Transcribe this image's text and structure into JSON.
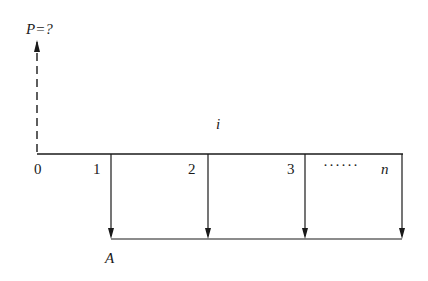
{
  "diagram": {
    "type": "cash-flow-diagram",
    "present_value_label": "P=?",
    "rate_label": "i",
    "annuity_label": "A",
    "period_labels": [
      "0",
      "1",
      "2",
      "3",
      "n"
    ],
    "ellipsis": "······",
    "colors": {
      "line": "#1a1a1a",
      "background": "#ffffff"
    }
  }
}
